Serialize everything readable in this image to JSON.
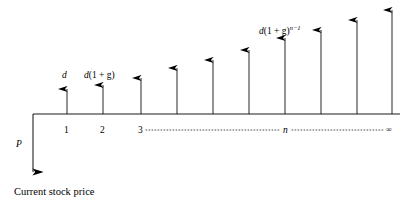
{
  "figure": {
    "type": "timeline-cash-flow-diagram",
    "title_caption": "Current stock price",
    "baseline": {
      "y": 114,
      "x_start": 33,
      "x_end": 400,
      "color": "#000000"
    },
    "present_value": {
      "symbol": "P",
      "direction": "down",
      "x": 33,
      "from_y": 114,
      "to_y": 172,
      "label_x": 16,
      "label_y": 140
    },
    "period_labels": [
      {
        "text": "1",
        "x": 64,
        "y": 126
      },
      {
        "text": "2",
        "x": 100,
        "y": 126
      },
      {
        "text": "3",
        "x": 138,
        "y": 126
      },
      {
        "text": "n",
        "x": 283,
        "y": 126,
        "italic": true
      },
      {
        "text": "∞",
        "x": 386,
        "y": 126,
        "small": true
      }
    ],
    "dotted_segments": [
      {
        "x1": 146,
        "x2": 281,
        "y": 130
      },
      {
        "x1": 292,
        "x2": 385,
        "y": 130
      }
    ],
    "cash_flow_arrows": [
      {
        "index": 1,
        "x": 67,
        "top_y": 89,
        "base_y": 114
      },
      {
        "index": 2,
        "x": 103,
        "top_y": 85,
        "base_y": 114
      },
      {
        "index": 3,
        "x": 141,
        "top_y": 78,
        "base_y": 114
      },
      {
        "index": 4,
        "x": 177,
        "top_y": 68,
        "base_y": 114
      },
      {
        "index": 5,
        "x": 213,
        "top_y": 60,
        "base_y": 114
      },
      {
        "index": 6,
        "x": 249,
        "top_y": 50,
        "base_y": 114
      },
      {
        "index": 7,
        "x": 285,
        "top_y": 38,
        "base_y": 114
      },
      {
        "index": 8,
        "x": 321,
        "top_y": 30,
        "base_y": 114
      },
      {
        "index": 9,
        "x": 357,
        "top_y": 20,
        "base_y": 114
      },
      {
        "index": 10,
        "x": 392,
        "top_y": 10,
        "base_y": 114
      }
    ],
    "flow_labels": [
      {
        "id": "d1",
        "base": "d",
        "paren": "",
        "sup": "",
        "x": 62,
        "y": 71
      },
      {
        "id": "d2",
        "base": "d",
        "paren": "(1 + g)",
        "sup": "",
        "x": 84,
        "y": 71
      },
      {
        "id": "dn",
        "base": "d",
        "paren": "(1 + g)",
        "sup": "n−1",
        "x": 259,
        "y": 25
      }
    ]
  }
}
